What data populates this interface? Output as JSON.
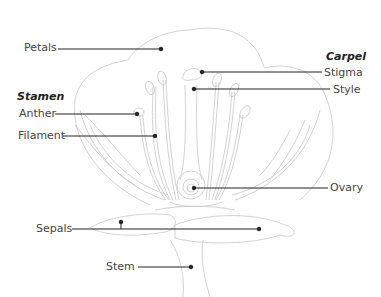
{
  "diagram": {
    "groups": {
      "stamen": "Stamen",
      "carpel": "Carpel"
    },
    "labels": {
      "petals": "Petals",
      "anther": "Anther",
      "filament": "Filament",
      "stigma": "Stigma",
      "style": "Style",
      "ovary": "Ovary",
      "sepals": "Sepals",
      "stem": "Stem"
    },
    "colors": {
      "outline": "#c8c8c8",
      "leader": "#222222",
      "label_text": "#444444"
    }
  }
}
